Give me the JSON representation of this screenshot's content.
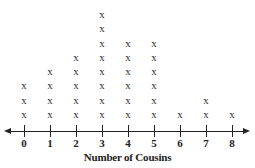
{
  "chart_data": {
    "type": "dot",
    "title": "",
    "xlabel": "Number of Cousins",
    "ylabel": "",
    "categories": [
      "0",
      "1",
      "2",
      "3",
      "4",
      "5",
      "6",
      "7",
      "8"
    ],
    "x": [
      0,
      1,
      2,
      3,
      4,
      5,
      6,
      7,
      8
    ],
    "values": [
      3,
      4,
      5,
      8,
      6,
      6,
      1,
      2,
      1
    ],
    "marker": "x",
    "xlim": [
      0,
      8
    ],
    "grid": false,
    "legend": null
  },
  "layout": {
    "x0_px": 24,
    "x_step_px": 26,
    "axis_y_px": 131,
    "first_mark_y_px": 115,
    "mark_step_px": 14.3,
    "marker_glyph": "x"
  }
}
